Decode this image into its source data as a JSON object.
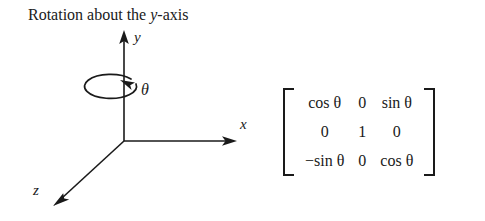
{
  "caption": {
    "prefix": "Rotation about the ",
    "variable": "y",
    "suffix": "-axis"
  },
  "diagram": {
    "name": "3d-axes-rotation-diagram",
    "axes": [
      {
        "id": "y",
        "label": "y",
        "direction": "up"
      },
      {
        "id": "x",
        "label": "x",
        "direction": "right"
      },
      {
        "id": "z",
        "label": "z",
        "direction": "down-left"
      }
    ],
    "rotation": {
      "label": "θ",
      "about_axis": "y",
      "indicator": "ellipse-with-arrowhead"
    },
    "origin": {
      "x": 124,
      "y": 141
    },
    "stroke_color": "#1a1a1a"
  },
  "matrix": {
    "name": "rotation-matrix-y",
    "rows": [
      [
        "cos θ",
        "0",
        "sin θ"
      ],
      [
        "0",
        "1",
        "0"
      ],
      [
        "−sin θ",
        "0",
        "cos θ"
      ]
    ],
    "bracket_left": "[",
    "bracket_right": "]"
  }
}
